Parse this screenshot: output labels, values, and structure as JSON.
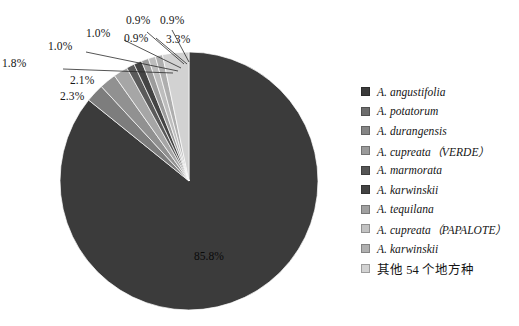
{
  "chart_data": {
    "type": "pie",
    "title": "",
    "subtitle": "",
    "xlabel": "",
    "ylabel": "",
    "legend_position": "right",
    "grid": false,
    "units": "percent",
    "categories": [
      "A. angustifolia",
      "A. potatorum",
      "A. durangensis",
      "A. cupreata（VERDE）",
      "A. marmorata",
      "A. karwinskii",
      "A. tequilana",
      "A. cupreata（PAPALOTE）",
      "A. karwinskii",
      "其他 54 个地方种"
    ],
    "values": [
      85.8,
      2.3,
      2.1,
      1.8,
      1.0,
      1.0,
      0.9,
      0.9,
      0.9,
      3.3
    ],
    "value_labels": [
      "85.8%",
      "2.3%",
      "2.1%",
      "1.8%",
      "1.0%",
      "1.0%",
      "0.9%",
      "0.9%",
      "0.9%",
      "3.3%"
    ],
    "colors": [
      "#3b3b3b",
      "#7d7d7d",
      "#919191",
      "#a6a6a6",
      "#5a5a5a",
      "#444444",
      "#9c9c9c",
      "#bdbdbd",
      "#aeaeae",
      "#d2d2d2"
    ]
  },
  "slice_labels": [
    {
      "text": "2.3%",
      "name": "slice-label-2-3"
    },
    {
      "text": "2.1%",
      "name": "slice-label-2-1"
    },
    {
      "text": "1.8%",
      "name": "slice-label-1-8"
    },
    {
      "text": "1.0%",
      "name": "slice-label-1-0-a"
    },
    {
      "text": "1.0%",
      "name": "slice-label-1-0-b"
    },
    {
      "text": "0.9%",
      "name": "slice-label-0-9-a"
    },
    {
      "text": "0.9%",
      "name": "slice-label-0-9-b"
    },
    {
      "text": "0.9%",
      "name": "slice-label-0-9-c"
    },
    {
      "text": "3.3%",
      "name": "slice-label-3-3"
    }
  ],
  "center_label": "85.8%",
  "legend": {
    "items": [
      {
        "label": "A. angustifolia",
        "color": "#3b3b3b",
        "cjk": false
      },
      {
        "label": "A. potatorum",
        "color": "#6d6d6d",
        "cjk": false
      },
      {
        "label": "A. durangensis",
        "color": "#858585",
        "cjk": false
      },
      {
        "label": "A. cupreata（VERDE）",
        "color": "#9a9a9a",
        "cjk": false
      },
      {
        "label": "A. marmorata",
        "color": "#555555",
        "cjk": false
      },
      {
        "label": "A. karwinskii",
        "color": "#434343",
        "cjk": false
      },
      {
        "label": "A. tequilana",
        "color": "#a0a0a0",
        "cjk": false
      },
      {
        "label": "A. cupreata（PAPALOTE）",
        "color": "#c2c2c2",
        "cjk": false
      },
      {
        "label": "A. karwinskii",
        "color": "#b0b0b0",
        "cjk": false
      },
      {
        "label": "其他 54 个地方种",
        "color": "#d2d2d2",
        "cjk": true
      }
    ]
  }
}
